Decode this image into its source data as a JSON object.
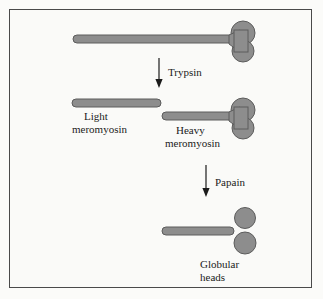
{
  "figure": {
    "background_color": "#fafaf8",
    "frame_color": "#4a4a4a",
    "shape_fill_color": "#8d8d8d",
    "shape_stroke_color": "#5c5c5c",
    "text_color": "#1b1b1b"
  },
  "steps": [
    {
      "id": "myosin",
      "label": "",
      "description": "Intact myosin: long tail rod with two-lobed globular head"
    },
    {
      "id": "trypsin-cleavage",
      "enzyme": "Trypsin"
    },
    {
      "id": "light-meromyosin",
      "label_line1": "Light",
      "label_line2": "meromyosin"
    },
    {
      "id": "heavy-meromyosin",
      "label_line1": "Heavy",
      "label_line2": "meromyosin"
    },
    {
      "id": "papain-cleavage",
      "enzyme": "Papain"
    },
    {
      "id": "globular-heads",
      "label_line1": "Globular",
      "label_line2": "heads"
    }
  ],
  "labels": {
    "trypsin": "Trypsin",
    "papain": "Papain",
    "light_line1": "Light",
    "light_line2": "meromyosin",
    "heavy_line1": "Heavy",
    "heavy_line2": "meromyosin",
    "globular_line1": "Globular",
    "globular_line2": "heads"
  }
}
